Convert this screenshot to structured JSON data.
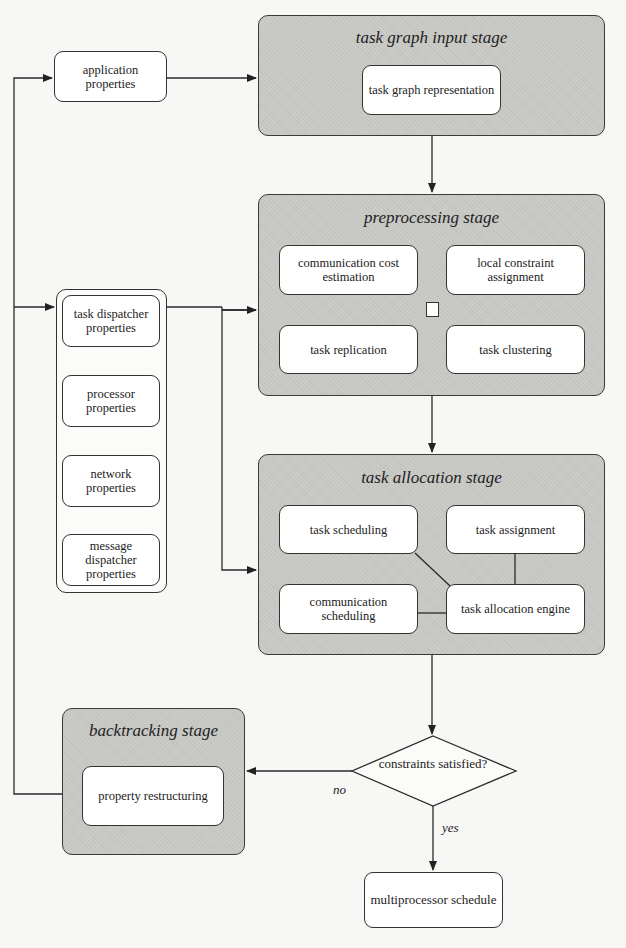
{
  "diagram": {
    "external_inputs": {
      "application_properties": "application properties",
      "property_group": [
        "task dispatcher properties",
        "processor properties",
        "network properties",
        "message dispatcher properties"
      ]
    },
    "stages": {
      "input": {
        "title": "task graph input stage",
        "components": [
          "task graph representation"
        ]
      },
      "preprocessing": {
        "title": "preprocessing stage",
        "components": [
          "communication cost estimation",
          "local constraint assignment",
          "task replication",
          "task clustering"
        ]
      },
      "allocation": {
        "title": "task allocation stage",
        "components": [
          "task scheduling",
          "task assignment",
          "communication scheduling",
          "task allocation engine"
        ]
      },
      "backtracking": {
        "title": "backtracking stage",
        "components": [
          "property restructuring"
        ]
      }
    },
    "decision": {
      "question": "constraints satisfied?",
      "no_label": "no",
      "yes_label": "yes"
    },
    "output": "multiprocessor schedule",
    "caption_partial": "…task allocation flow in the TRACE…"
  }
}
